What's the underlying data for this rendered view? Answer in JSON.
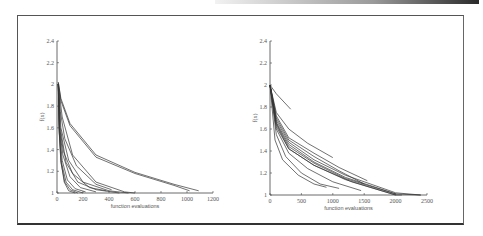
{
  "figure": {
    "frame_color": "#555555",
    "line_color": "#333333"
  },
  "chart_data": [
    {
      "type": "line",
      "title": "",
      "xlabel": "function evaluations",
      "ylabel": "f(x)",
      "xlim": [
        0,
        1200
      ],
      "ylim": [
        1,
        2.4
      ],
      "xticks": [
        0,
        200,
        400,
        600,
        800,
        1000,
        1200
      ],
      "xtick_labels": [
        "0",
        "200",
        "400",
        "600",
        "800",
        "1000",
        "1200"
      ],
      "yticks": [
        1,
        1.2,
        1.4,
        1.6,
        1.8,
        2,
        2.2,
        2.4
      ],
      "ytick_labels": [
        "1",
        "1.2",
        "1.4",
        "1.6",
        "1.8",
        "2",
        "2.2",
        "2.4"
      ],
      "grid": false,
      "legend": null,
      "series": [
        {
          "name": "run1",
          "x": [
            10,
            30,
            100,
            300,
            600,
            900,
            1020
          ],
          "y": [
            2.02,
            1.85,
            1.62,
            1.33,
            1.18,
            1.07,
            1.02
          ]
        },
        {
          "name": "run2",
          "x": [
            10,
            30,
            100,
            300,
            600,
            900,
            1090
          ],
          "y": [
            2.02,
            1.87,
            1.64,
            1.35,
            1.19,
            1.08,
            1.02
          ]
        },
        {
          "name": "run3",
          "x": [
            10,
            25,
            60,
            150,
            300,
            420
          ],
          "y": [
            2.0,
            1.75,
            1.5,
            1.25,
            1.08,
            1.03
          ]
        },
        {
          "name": "run4",
          "x": [
            10,
            20,
            50,
            120,
            250,
            380
          ],
          "y": [
            2.0,
            1.6,
            1.38,
            1.18,
            1.05,
            1.02
          ]
        },
        {
          "name": "run5",
          "x": [
            10,
            20,
            45,
            100,
            180,
            300
          ],
          "y": [
            2.0,
            1.58,
            1.35,
            1.15,
            1.05,
            1.01
          ]
        },
        {
          "name": "run6",
          "x": [
            10,
            20,
            40,
            80,
            140,
            220
          ],
          "y": [
            2.0,
            1.57,
            1.3,
            1.12,
            1.04,
            1.01
          ]
        },
        {
          "name": "run7",
          "x": [
            10,
            18,
            35,
            70,
            120,
            200
          ],
          "y": [
            2.0,
            1.55,
            1.28,
            1.1,
            1.03,
            1.0
          ]
        },
        {
          "name": "run8",
          "x": [
            10,
            16,
            30,
            60,
            100,
            160
          ],
          "y": [
            2.0,
            1.58,
            1.28,
            1.1,
            1.03,
            1.0
          ]
        },
        {
          "name": "run9",
          "x": [
            10,
            15,
            30,
            55,
            90,
            140
          ],
          "y": [
            2.0,
            1.62,
            1.3,
            1.1,
            1.02,
            1.0
          ]
        },
        {
          "name": "run10",
          "x": [
            10,
            40,
            120,
            300,
            520,
            600
          ],
          "y": [
            2.0,
            1.7,
            1.35,
            1.1,
            1.01,
            1.0
          ]
        },
        {
          "name": "run11",
          "x": [
            10,
            30,
            90,
            200,
            400,
            550
          ],
          "y": [
            2.0,
            1.6,
            1.3,
            1.1,
            1.02,
            1.0
          ]
        },
        {
          "name": "run12",
          "x": [
            10,
            25,
            70,
            160,
            300,
            480
          ],
          "y": [
            2.0,
            1.6,
            1.28,
            1.1,
            1.03,
            1.0
          ]
        }
      ]
    },
    {
      "type": "line",
      "title": "",
      "xlabel": "function evaluations",
      "ylabel": "f(x)",
      "xlim": [
        0,
        2500
      ],
      "ylim": [
        1,
        2.4
      ],
      "xticks": [
        0,
        500,
        1000,
        1500,
        2000,
        2500
      ],
      "xtick_labels": [
        "0",
        "500",
        "1000",
        "1500",
        "2000",
        "2500"
      ],
      "yticks": [
        1,
        1.2,
        1.4,
        1.6,
        1.8,
        2,
        2.2,
        2.4
      ],
      "ytick_labels": [
        "1",
        "1.2",
        "1.4",
        "1.6",
        "1.8",
        "2",
        "2.2",
        "2.4"
      ],
      "grid": false,
      "legend": null,
      "series": [
        {
          "name": "run1",
          "x": [
            0,
            100,
            330
          ],
          "y": [
            2.0,
            1.92,
            1.78
          ]
        },
        {
          "name": "run2",
          "x": [
            0,
            100,
            300,
            600,
            1000
          ],
          "y": [
            2.0,
            1.75,
            1.6,
            1.47,
            1.34
          ]
        },
        {
          "name": "run3",
          "x": [
            0,
            100,
            300,
            700,
            1100,
            1550
          ],
          "y": [
            2.0,
            1.72,
            1.52,
            1.38,
            1.25,
            1.13
          ]
        },
        {
          "name": "run4",
          "x": [
            0,
            100,
            300,
            700,
            1100,
            1500
          ],
          "y": [
            2.0,
            1.7,
            1.5,
            1.35,
            1.22,
            1.1
          ]
        },
        {
          "name": "run5",
          "x": [
            0,
            100,
            300,
            700,
            1200,
            2000,
            2400
          ],
          "y": [
            2.0,
            1.68,
            1.48,
            1.32,
            1.18,
            1.02,
            1.0
          ]
        },
        {
          "name": "run6",
          "x": [
            0,
            100,
            300,
            700,
            1200,
            2000,
            2400
          ],
          "y": [
            2.0,
            1.66,
            1.46,
            1.3,
            1.16,
            1.01,
            1.0
          ]
        },
        {
          "name": "run7",
          "x": [
            0,
            100,
            300,
            700,
            1200,
            2000
          ],
          "y": [
            2.0,
            1.65,
            1.44,
            1.29,
            1.15,
            1.01
          ]
        },
        {
          "name": "run8",
          "x": [
            0,
            100,
            300,
            700,
            1200,
            2000
          ],
          "y": [
            2.0,
            1.62,
            1.42,
            1.27,
            1.14,
            1.0
          ]
        },
        {
          "name": "run9",
          "x": [
            0,
            100,
            300,
            600,
            1000,
            1450
          ],
          "y": [
            2.0,
            1.6,
            1.38,
            1.24,
            1.12,
            1.04
          ]
        },
        {
          "name": "run10",
          "x": [
            0,
            100,
            250,
            500,
            800,
            1100
          ],
          "y": [
            2.0,
            1.55,
            1.35,
            1.2,
            1.1,
            1.06
          ]
        },
        {
          "name": "run11",
          "x": [
            0,
            80,
            200,
            450,
            700,
            900
          ],
          "y": [
            2.0,
            1.5,
            1.32,
            1.18,
            1.1,
            1.07
          ]
        },
        {
          "name": "run12",
          "x": [
            0,
            100,
            300,
            700,
            1300,
            2000,
            2100
          ],
          "y": [
            2.0,
            1.64,
            1.42,
            1.27,
            1.12,
            1.0,
            1.0
          ]
        }
      ]
    }
  ]
}
